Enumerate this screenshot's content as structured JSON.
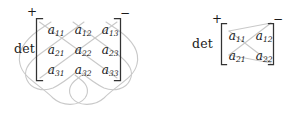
{
  "figure": {
    "background_color": "#ffffff",
    "text_color": "#1a1a1a",
    "line_color": "#c8c8c8",
    "bracket_color": "#3a3a3a"
  },
  "determinant_3x3": {
    "label": "det",
    "plus_sign": "+",
    "minus_sign": "−",
    "size": "3x3",
    "rows": [
      [
        {
          "base": "a",
          "sub": "11"
        },
        {
          "base": "a",
          "sub": "12"
        },
        {
          "base": "a",
          "sub": "13"
        }
      ],
      [
        {
          "base": "a",
          "sub": "21"
        },
        {
          "base": "a",
          "sub": "22"
        },
        {
          "base": "a",
          "sub": "23"
        }
      ],
      [
        {
          "base": "a",
          "sub": "31"
        },
        {
          "base": "a",
          "sub": "32"
        },
        {
          "base": "a",
          "sub": "33"
        }
      ]
    ]
  },
  "determinant_2x2": {
    "label": "det",
    "plus_sign": "+",
    "minus_sign": "−",
    "size": "2x2",
    "rows": [
      [
        {
          "base": "a",
          "sub": "11"
        },
        {
          "base": "a",
          "sub": "12"
        }
      ],
      [
        {
          "base": "a",
          "sub": "21"
        },
        {
          "base": "a",
          "sub": "22"
        }
      ]
    ]
  }
}
